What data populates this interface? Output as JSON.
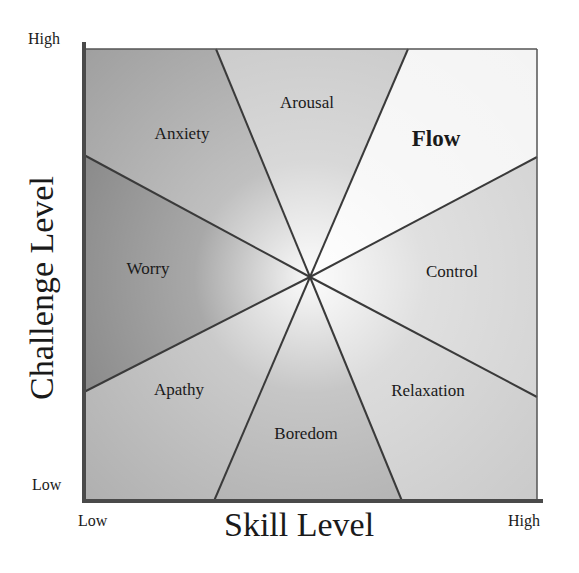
{
  "diagram": {
    "x_axis": {
      "title": "Skill Level",
      "low_label": "Low",
      "high_label": "High"
    },
    "y_axis": {
      "title": "Challenge Level",
      "low_label": "Low",
      "high_label": "High"
    },
    "center": [
      310,
      277
    ],
    "plot_area": {
      "left": 84,
      "top": 49,
      "right": 537,
      "bottom": 501
    },
    "regions": [
      {
        "name": "Anxiety",
        "label": "Anxiety",
        "emphasis": false
      },
      {
        "name": "Arousal",
        "label": "Arousal",
        "emphasis": false
      },
      {
        "name": "Flow",
        "label": "Flow",
        "emphasis": true
      },
      {
        "name": "Control",
        "label": "Control",
        "emphasis": false
      },
      {
        "name": "Relaxation",
        "label": "Relaxation",
        "emphasis": false
      },
      {
        "name": "Boredom",
        "label": "Boredom",
        "emphasis": false
      },
      {
        "name": "Apathy",
        "label": "Apathy",
        "emphasis": false
      },
      {
        "name": "Worry",
        "label": "Worry",
        "emphasis": false
      }
    ],
    "colors": {
      "line": "#3a3a3a",
      "axis": "#4a4a4a",
      "anxiety": "#9e9e9e",
      "arousal": "#c4c4c4",
      "flow": "#f4f4f4",
      "control": "#cfcfcf",
      "relaxation": "#c9c9c9",
      "boredom": "#a8a8a8",
      "apathy": "#aeaeae",
      "worry": "#7a7a7a"
    }
  }
}
